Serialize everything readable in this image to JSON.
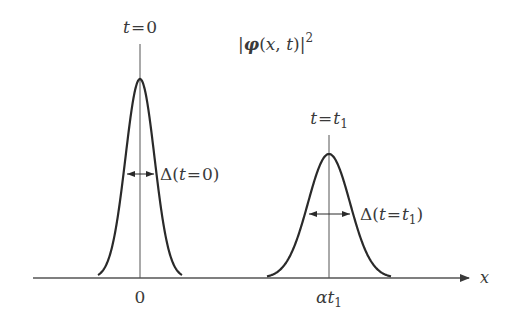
{
  "diagram": {
    "title_parts": {
      "bar1": "|",
      "phi": "φ",
      "open": "(",
      "x": "x",
      "comma": ", ",
      "t": "t",
      "close": ")",
      "bar2": "|",
      "exp": "2"
    },
    "axis": {
      "label": "x",
      "ticks": [
        "0",
        "αt₁"
      ]
    },
    "tick_parts": {
      "zero": "0",
      "alpha": "α",
      "t": "t",
      "sub": "1"
    },
    "packets": [
      {
        "time_label": {
          "t": "t",
          "eq": "=",
          "val": "0",
          "sub": ""
        },
        "width_label": {
          "delta": "Δ",
          "open": "(",
          "t": "t",
          "eq": "=",
          "val": "0",
          "sub": "",
          "close": ")"
        }
      },
      {
        "time_label": {
          "t": "t",
          "eq": "=",
          "val": "t",
          "sub": "1"
        },
        "width_label": {
          "delta": "Δ",
          "open": "(",
          "t": "t",
          "eq": "=",
          "val": "t",
          "sub": "1",
          "close": ")"
        }
      }
    ],
    "colors": {
      "curve": "#2a2a2a",
      "line": "#555555",
      "text": "#3a3a3a",
      "background": "#ffffff"
    }
  }
}
